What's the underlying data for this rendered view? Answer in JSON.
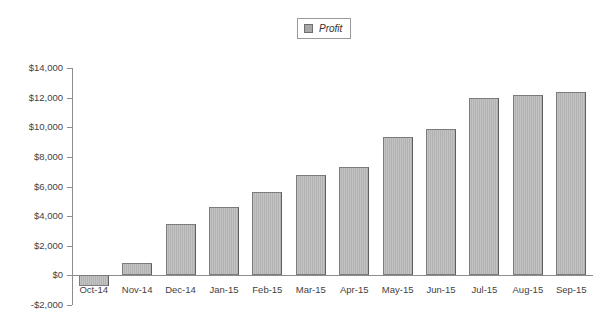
{
  "legend": {
    "position": "top-center",
    "entries": [
      {
        "label": "Profit",
        "swatch_color": "#a8a8a8",
        "italic": true
      }
    ]
  },
  "axis": {
    "y_ticks": [
      "$14,000",
      "$12,000",
      "$10,000",
      "$8,000",
      "$6,000",
      "$4,000",
      "$2,000",
      "$0",
      "-$2,000"
    ]
  },
  "chart_data": {
    "type": "bar",
    "title": "",
    "xlabel": "",
    "ylabel": "",
    "categories": [
      "Oct-14",
      "Nov-14",
      "Dec-14",
      "Jan-15",
      "Feb-15",
      "Mar-15",
      "Apr-15",
      "May-15",
      "Jun-15",
      "Jul-15",
      "Aug-15",
      "Sep-15"
    ],
    "series": [
      {
        "name": "Profit",
        "color": "#b2b2b2",
        "values": [
          -700,
          850,
          3450,
          4600,
          5600,
          6800,
          7300,
          9350,
          9850,
          11950,
          12200,
          12400
        ]
      }
    ],
    "ylim": [
      -2000,
      14000
    ],
    "ytick_values": [
      14000,
      12000,
      10000,
      8000,
      6000,
      4000,
      2000,
      0,
      -2000
    ],
    "ytick_labels": [
      "$14,000",
      "$12,000",
      "$10,000",
      "$8,000",
      "$6,000",
      "$4,000",
      "$2,000",
      "$0",
      "-$2,000"
    ],
    "grid": false,
    "legend_position": "top-center",
    "value_prefix": "$",
    "zero_line": true
  }
}
